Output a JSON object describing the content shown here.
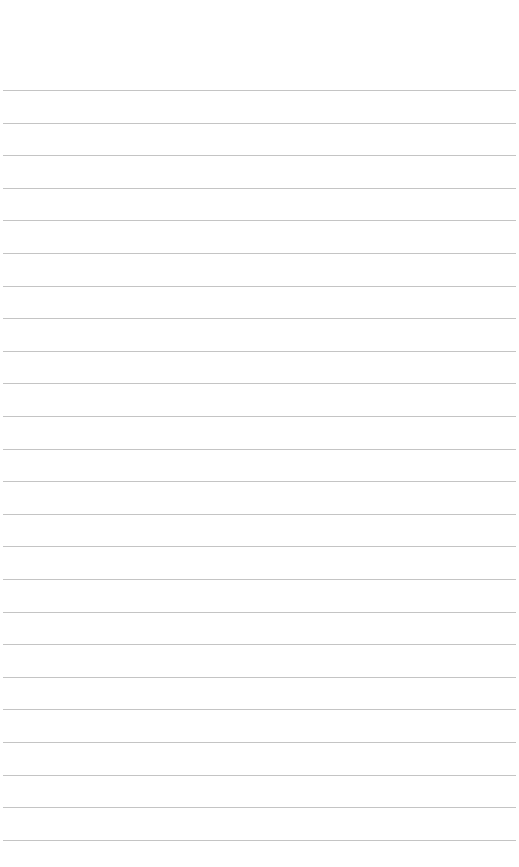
{
  "page": {
    "type": "lined-paper",
    "background_color": "#ffffff",
    "line_color": "#c4c4c4",
    "first_line_y": 90,
    "line_spacing": 32.6,
    "line_count": 24,
    "text_lines": [
      "",
      "",
      "",
      "",
      "",
      "",
      "",
      "",
      "",
      "",
      "",
      "",
      "",
      "",
      "",
      "",
      "",
      "",
      "",
      "",
      "",
      "",
      "",
      ""
    ]
  }
}
